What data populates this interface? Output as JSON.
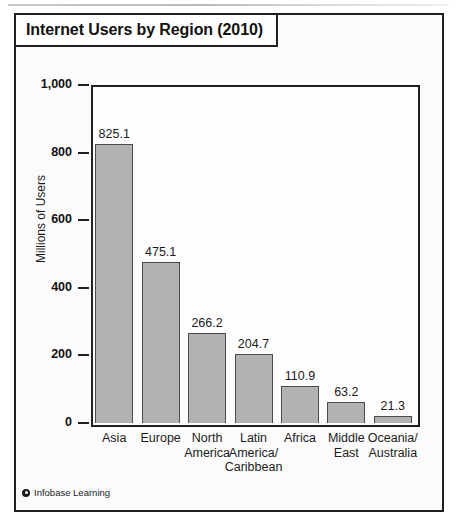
{
  "title": "Internet Users by Region (2010)",
  "credit": {
    "mark": "copyright-circle-icon",
    "text": "Infobase Learning"
  },
  "colors": {
    "bar_fill": "#b2b2b2",
    "bar_stroke": "#4a4a4a",
    "frame": "#231f20",
    "text": "#1b1b1b",
    "card_background": "#fbfbfb"
  },
  "chart_data": {
    "type": "bar",
    "title": "Internet Users by Region (2010)",
    "xlabel": "",
    "ylabel": "Millions of Users",
    "ylim": [
      0,
      1000
    ],
    "yticks": [
      0,
      200,
      400,
      600,
      800,
      1000
    ],
    "ytick_labels": [
      "0",
      "200",
      "400",
      "600",
      "800",
      "1,000"
    ],
    "grid": false,
    "legend": "none",
    "categories": [
      "Asia",
      "Europe",
      "North America",
      "Latin America/ Caribbean",
      "Africa",
      "Middle East",
      "Oceania/ Australia"
    ],
    "category_lines": [
      [
        "Asia"
      ],
      [
        "Europe"
      ],
      [
        "North",
        "America"
      ],
      [
        "Latin",
        "America/",
        "Caribbean"
      ],
      [
        "Africa"
      ],
      [
        "Middle",
        "East"
      ],
      [
        "Oceania/",
        "Australia"
      ]
    ],
    "values": [
      825.1,
      475.1,
      266.2,
      204.7,
      110.9,
      63.2,
      21.3
    ],
    "value_labels": [
      "825.1",
      "475.1",
      "266.2",
      "204.7",
      "110.9",
      "63.2",
      "21.3"
    ]
  }
}
